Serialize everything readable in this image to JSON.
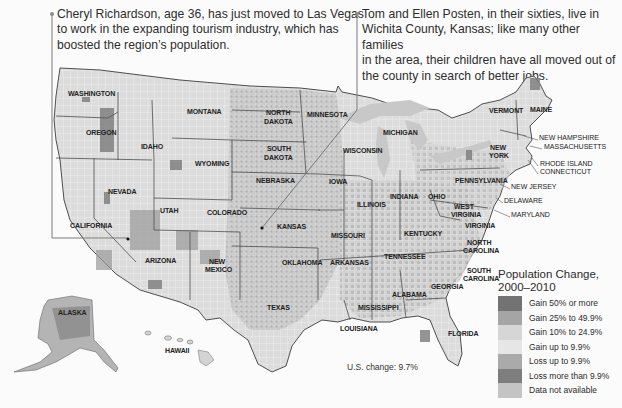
{
  "callouts": [
    {
      "id": "cheryl",
      "text_lines": [
        "Cheryl Richardson, age 36, has just moved to Las Vegas",
        "to work in the expanding tourism industry, which has",
        "boosted the region’s population."
      ]
    },
    {
      "id": "posten",
      "text_lines": [
        "Tom and Ellen Posten, in their sixties, live in",
        "Wichita County, Kansas; like many other families",
        "in the area, their children have all moved out of",
        "the county in search of better jobs."
      ]
    }
  ],
  "state_labels": [
    {
      "name": "WASHINGTON",
      "x": 68,
      "y": 96
    },
    {
      "name": "OREGON",
      "x": 86,
      "y": 135
    },
    {
      "name": "IDAHO",
      "x": 141,
      "y": 149
    },
    {
      "name": "MONTANA",
      "x": 187,
      "y": 114
    },
    {
      "name": "WYOMING",
      "x": 195,
      "y": 166
    },
    {
      "name": "NORTH",
      "x": 266,
      "y": 115
    },
    {
      "name": "DAKOTA",
      "x": 264,
      "y": 124
    },
    {
      "name": "SOUTH",
      "x": 267,
      "y": 151
    },
    {
      "name": "DAKOTA",
      "x": 264,
      "y": 160
    },
    {
      "name": "MINNESOTA",
      "x": 307,
      "y": 117
    },
    {
      "name": "WISCONSIN",
      "x": 343,
      "y": 153
    },
    {
      "name": "MICHIGAN",
      "x": 383,
      "y": 135
    },
    {
      "name": "NEBRASKA",
      "x": 256,
      "y": 183
    },
    {
      "name": "IOWA",
      "x": 329,
      "y": 184
    },
    {
      "name": "NEVADA",
      "x": 108,
      "y": 194
    },
    {
      "name": "UTAH",
      "x": 160,
      "y": 213
    },
    {
      "name": "COLORADO",
      "x": 207,
      "y": 215
    },
    {
      "name": "KANSAS",
      "x": 277,
      "y": 229
    },
    {
      "name": "ILLINOIS",
      "x": 357,
      "y": 207
    },
    {
      "name": "INDIANA",
      "x": 390,
      "y": 199
    },
    {
      "name": "OHIO",
      "x": 428,
      "y": 199
    },
    {
      "name": "CALIFORNIA",
      "x": 70,
      "y": 228
    },
    {
      "name": "MISSOURI",
      "x": 331,
      "y": 238
    },
    {
      "name": "KENTUCKY",
      "x": 404,
      "y": 236
    },
    {
      "name": "WEST",
      "x": 454,
      "y": 209
    },
    {
      "name": "VIRGINIA",
      "x": 451,
      "y": 217
    },
    {
      "name": "VIRGINIA",
      "x": 465,
      "y": 228
    },
    {
      "name": "ARIZONA",
      "x": 145,
      "y": 263
    },
    {
      "name": "NEW",
      "x": 209,
      "y": 264
    },
    {
      "name": "MEXICO",
      "x": 205,
      "y": 272
    },
    {
      "name": "OKLAHOMA",
      "x": 282,
      "y": 265
    },
    {
      "name": "ARKANSAS",
      "x": 330,
      "y": 265
    },
    {
      "name": "TENNESSEE",
      "x": 384,
      "y": 259
    },
    {
      "name": "NORTH",
      "x": 467,
      "y": 245
    },
    {
      "name": "CAROLINA",
      "x": 463,
      "y": 253
    },
    {
      "name": "SOUTH",
      "x": 467,
      "y": 273
    },
    {
      "name": "CAROLINA",
      "x": 463,
      "y": 281
    },
    {
      "name": "GEORGIA",
      "x": 431,
      "y": 289
    },
    {
      "name": "ALABAMA",
      "x": 392,
      "y": 297
    },
    {
      "name": "MISSISSIPPI",
      "x": 358,
      "y": 310
    },
    {
      "name": "TEXAS",
      "x": 267,
      "y": 310
    },
    {
      "name": "LOUISIANA",
      "x": 340,
      "y": 331
    },
    {
      "name": "FLORIDA",
      "x": 448,
      "y": 336
    },
    {
      "name": "PENNSYLVANIA",
      "x": 455,
      "y": 183
    },
    {
      "name": "NEW",
      "x": 490,
      "y": 150
    },
    {
      "name": "YORK",
      "x": 489,
      "y": 158
    },
    {
      "name": "VERMONT",
      "x": 489,
      "y": 113
    },
    {
      "name": "MAINE",
      "x": 530,
      "y": 112
    },
    {
      "name": "ALASKA",
      "x": 58,
      "y": 315
    },
    {
      "name": "HAWAII",
      "x": 165,
      "y": 353
    }
  ],
  "external_labels": [
    {
      "name": "NEW HAMPSHIRE",
      "x": 539,
      "y": 140
    },
    {
      "name": "MASSACHUSETTS",
      "x": 544,
      "y": 149
    },
    {
      "name": "RHODE ISLAND",
      "x": 540,
      "y": 166
    },
    {
      "name": "CONNECTICUT",
      "x": 540,
      "y": 174
    },
    {
      "name": "NEW JERSEY",
      "x": 511,
      "y": 189
    },
    {
      "name": "DELAWARE",
      "x": 504,
      "y": 203
    },
    {
      "name": "MARYLAND",
      "x": 511,
      "y": 217
    }
  ],
  "legend": {
    "title_line1": "Population Change,",
    "title_line2": "2000–2010",
    "items": [
      {
        "label": "Gain 50% or more",
        "color": "#737373"
      },
      {
        "label": "Gain 25% to 49.9%",
        "color": "#a5a5a5"
      },
      {
        "label": "Gain 10% to 24.9%",
        "color": "#d6d6d6"
      },
      {
        "label": "Gain up to 9.9%",
        "color": "#e6e6e6"
      },
      {
        "label": "Loss up to 9.9%",
        "color": "#aaaaaa"
      },
      {
        "label": "Loss more than 9.9%",
        "color": "#7e7e7e"
      },
      {
        "label": "Data not available",
        "color": "#c4c4c4"
      }
    ]
  },
  "us_change": "U.S. change: 9.7%",
  "colors": {
    "land_base": "#d9d9d9",
    "border": "#555555",
    "water": "#c9c9c9",
    "leader_line": "#7a7a7a"
  }
}
